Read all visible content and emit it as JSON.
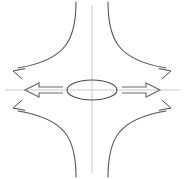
{
  "figure": {
    "width": 185,
    "height": 179,
    "background_color": "#ffffff",
    "colors": {
      "axis": "#c9c9c9",
      "curve": "#555555",
      "ellipse": "#4d4d4d",
      "block_arrow": "#6b6b6b",
      "curved_arrow": "#4a4a4a"
    },
    "stroke_widths": {
      "axis": 1.0,
      "curve": 1.1,
      "ellipse": 1.1,
      "block_arrow": 1.2,
      "curved_arrow": 1.0
    }
  },
  "geometry": {
    "center": {
      "x": 92,
      "y": 90
    },
    "axes": {
      "vertical": {
        "x": 92,
        "y1": 6,
        "y2": 173
      },
      "horizontal": {
        "y": 90,
        "x1": 5,
        "x2": 180
      }
    },
    "ellipse": {
      "cx": 92,
      "cy": 90,
      "rx": 25,
      "ry": 10
    },
    "hyperbola_branches": [
      {
        "name": "upper-left-branch",
        "path": "M 76 2 C 76 40, 66 60, 18 68"
      },
      {
        "name": "upper-right-branch",
        "path": "M 108 2 C 108 40, 118 60, 166 68"
      },
      {
        "name": "lower-left-branch",
        "path": "M 76 177 C 76 139, 66 119, 18 111"
      },
      {
        "name": "lower-right-branch",
        "path": "M 108 177 C 108 139, 118 119, 166 111"
      }
    ],
    "block_arrows": [
      {
        "name": "left-outflow-arrow",
        "direction": "left",
        "tip": {
          "x": 25,
          "y": 90
        },
        "tail": {
          "x": 63,
          "y": 90
        },
        "head_length": 14,
        "half_height": 7,
        "shaft_half_height": 3
      },
      {
        "name": "right-outflow-arrow",
        "direction": "right",
        "tip": {
          "x": 160,
          "y": 90
        },
        "tail": {
          "x": 122,
          "y": 90
        },
        "head_length": 14,
        "half_height": 7,
        "shaft_half_height": 3
      }
    ],
    "curved_arrow_heads": [
      {
        "name": "upper-left-arrowhead",
        "x": 13,
        "y": 71,
        "angle_deg": 195
      },
      {
        "name": "upper-right-arrowhead",
        "x": 171,
        "y": 71,
        "angle_deg": 345
      },
      {
        "name": "lower-left-arrowhead",
        "x": 13,
        "y": 108,
        "angle_deg": 165
      },
      {
        "name": "lower-right-arrowhead",
        "x": 171,
        "y": 108,
        "angle_deg": 15
      }
    ]
  },
  "labels": {
    "text_items": []
  }
}
